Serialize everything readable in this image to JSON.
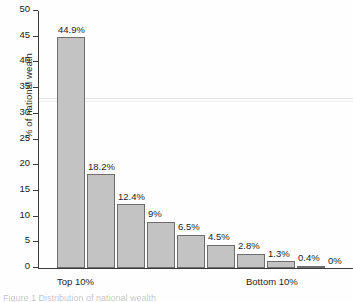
{
  "chart_data": {
    "type": "bar",
    "title": "",
    "subtitle": "",
    "xlabel": "",
    "ylabel": "% of national weath",
    "categories": [
      "Top 10%",
      "2nd 10%",
      "3rd 10%",
      "4th 10%",
      "5th 10%",
      "6th 10%",
      "7th 10%",
      "8th 10%",
      "9th 10%",
      "Bottom 10%"
    ],
    "values": [
      44.9,
      18.2,
      12.4,
      9,
      6.5,
      4.5,
      2.8,
      1.3,
      0.4,
      0
    ],
    "data_labels": [
      "44.9%",
      "18.2%",
      "12.4%",
      "9%",
      "6.5%",
      "4.5%",
      "2.8%",
      "1.3%",
      "0.4%",
      "0%"
    ],
    "ylim": [
      0,
      50
    ],
    "yticks": [
      0,
      5,
      10,
      15,
      20,
      25,
      30,
      35,
      40,
      45,
      50
    ],
    "ytick_labels": [
      "0",
      "5",
      "10",
      "15",
      "20",
      "25",
      "30",
      "35",
      "40",
      "45",
      "50"
    ],
    "grid": false,
    "legend": null,
    "legend_position": "none",
    "bar_fill_color": "#c3c3c3",
    "bar_edge_color": "#6e6e6e",
    "axis_color": "#3a3a3a"
  },
  "axis_captions": {
    "left_label": "Top 10%",
    "right_label": "Bottom 10%"
  },
  "figure_caption": "Figure 1   Distribution of national wealth"
}
